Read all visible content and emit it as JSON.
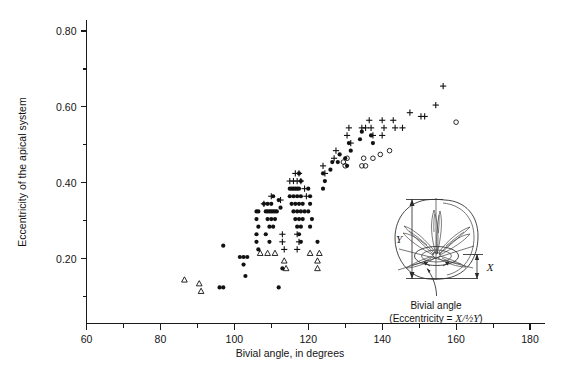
{
  "chart_data": {
    "type": "scatter",
    "title": "",
    "xlabel": "Bivial angle, in degrees",
    "ylabel": "Eccentricity of the apical system",
    "xlim": [
      60,
      180
    ],
    "ylim": [
      0.03,
      0.855
    ],
    "grid": false,
    "legend": "none",
    "x_major_ticks": [
      60,
      80,
      100,
      120,
      140,
      160,
      180
    ],
    "x_major_tick_labels": [
      "60",
      "80",
      "100",
      "120",
      "140",
      "160",
      "180"
    ],
    "x_minor_ticks": [
      70,
      90,
      110,
      130,
      150,
      170
    ],
    "y_major_ticks": [
      0.2,
      0.4,
      0.6,
      0.8
    ],
    "y_major_tick_labels": [
      "0.20",
      "0.40",
      "0.60",
      "0.80"
    ],
    "y_minor_ticks": [
      0.1,
      0.3,
      0.5,
      0.7
    ],
    "series": [
      {
        "name": "filled-circle",
        "marker": "filled-circle",
        "points": [
          [
            97.0,
            0.235
          ],
          [
            97.0,
            0.125
          ],
          [
            101.5,
            0.205
          ],
          [
            102.5,
            0.205
          ],
          [
            103.5,
            0.205
          ],
          [
            102.5,
            0.185
          ],
          [
            103.0,
            0.155
          ],
          [
            106.0,
            0.325
          ],
          [
            106.5,
            0.325
          ],
          [
            106.0,
            0.305
          ],
          [
            106.5,
            0.285
          ],
          [
            106.0,
            0.265
          ],
          [
            106.0,
            0.245
          ],
          [
            106.5,
            0.225
          ],
          [
            108.0,
            0.345
          ],
          [
            108.5,
            0.325
          ],
          [
            109.0,
            0.325
          ],
          [
            109.5,
            0.325
          ],
          [
            110.0,
            0.325
          ],
          [
            110.5,
            0.325
          ],
          [
            111.0,
            0.325
          ],
          [
            111.5,
            0.325
          ],
          [
            109.0,
            0.305
          ],
          [
            110.0,
            0.305
          ],
          [
            111.0,
            0.305
          ],
          [
            109.5,
            0.285
          ],
          [
            110.5,
            0.285
          ],
          [
            109.0,
            0.345
          ],
          [
            110.0,
            0.345
          ],
          [
            110.5,
            0.365
          ],
          [
            108.5,
            0.265
          ],
          [
            109.5,
            0.245
          ],
          [
            112.0,
            0.355
          ],
          [
            112.5,
            0.335
          ],
          [
            113.0,
            0.175
          ],
          [
            115.0,
            0.385
          ],
          [
            115.5,
            0.385
          ],
          [
            116.0,
            0.385
          ],
          [
            116.5,
            0.385
          ],
          [
            117.0,
            0.385
          ],
          [
            117.5,
            0.385
          ],
          [
            115.0,
            0.365
          ],
          [
            116.0,
            0.365
          ],
          [
            117.0,
            0.365
          ],
          [
            118.0,
            0.365
          ],
          [
            115.5,
            0.345
          ],
          [
            116.5,
            0.345
          ],
          [
            117.5,
            0.345
          ],
          [
            118.5,
            0.345
          ],
          [
            116.0,
            0.325
          ],
          [
            117.0,
            0.325
          ],
          [
            118.0,
            0.325
          ],
          [
            119.0,
            0.325
          ],
          [
            116.5,
            0.305
          ],
          [
            117.5,
            0.305
          ],
          [
            118.5,
            0.305
          ],
          [
            117.0,
            0.285
          ],
          [
            118.0,
            0.285
          ],
          [
            117.5,
            0.265
          ],
          [
            118.0,
            0.245
          ],
          [
            118.0,
            0.405
          ],
          [
            117.5,
            0.425
          ],
          [
            120.0,
            0.385
          ],
          [
            120.5,
            0.365
          ],
          [
            120.5,
            0.345
          ],
          [
            120.0,
            0.325
          ],
          [
            121.0,
            0.305
          ],
          [
            120.5,
            0.285
          ],
          [
            122.5,
            0.245
          ],
          [
            124.0,
            0.385
          ],
          [
            124.5,
            0.405
          ],
          [
            124.0,
            0.425
          ],
          [
            126.0,
            0.435
          ],
          [
            126.5,
            0.455
          ],
          [
            128.0,
            0.455
          ],
          [
            128.5,
            0.475
          ],
          [
            130.0,
            0.465
          ],
          [
            130.5,
            0.445
          ],
          [
            131.0,
            0.505
          ],
          [
            131.5,
            0.485
          ],
          [
            134.0,
            0.515
          ],
          [
            134.5,
            0.535
          ],
          [
            137.0,
            0.525
          ],
          [
            137.5,
            0.505
          ],
          [
            112.0,
            0.125
          ],
          [
            96.0,
            0.125
          ]
        ]
      },
      {
        "name": "open-circle",
        "marker": "open-circle",
        "points": [
          [
            129.5,
            0.455
          ],
          [
            130.0,
            0.445
          ],
          [
            130.5,
            0.465
          ],
          [
            134.5,
            0.445
          ],
          [
            135.0,
            0.465
          ],
          [
            135.5,
            0.445
          ],
          [
            137.5,
            0.465
          ],
          [
            139.5,
            0.475
          ],
          [
            142.0,
            0.485
          ],
          [
            160.0,
            0.56
          ]
        ]
      },
      {
        "name": "open-triangle",
        "marker": "open-triangle",
        "points": [
          [
            86.5,
            0.145
          ],
          [
            90.5,
            0.135
          ],
          [
            91.0,
            0.115
          ],
          [
            107.0,
            0.215
          ],
          [
            109.0,
            0.215
          ],
          [
            111.0,
            0.215
          ],
          [
            113.5,
            0.195
          ],
          [
            114.0,
            0.175
          ],
          [
            120.5,
            0.215
          ],
          [
            123.0,
            0.215
          ],
          [
            122.5,
            0.195
          ],
          [
            122.5,
            0.175
          ]
        ]
      },
      {
        "name": "plus",
        "marker": "plus",
        "points": [
          [
            108.0,
            0.345
          ],
          [
            110.0,
            0.365
          ],
          [
            112.5,
            0.355
          ],
          [
            115.0,
            0.405
          ],
          [
            116.0,
            0.405
          ],
          [
            117.0,
            0.405
          ],
          [
            118.0,
            0.405
          ],
          [
            116.5,
            0.425
          ],
          [
            117.5,
            0.425
          ],
          [
            119.0,
            0.385
          ],
          [
            119.5,
            0.365
          ],
          [
            117.0,
            0.265
          ],
          [
            117.5,
            0.245
          ],
          [
            117.0,
            0.225
          ],
          [
            113.0,
            0.265
          ],
          [
            113.0,
            0.245
          ],
          [
            113.5,
            0.225
          ],
          [
            124.0,
            0.445
          ],
          [
            124.5,
            0.425
          ],
          [
            127.0,
            0.465
          ],
          [
            127.5,
            0.485
          ],
          [
            130.5,
            0.525
          ],
          [
            131.0,
            0.545
          ],
          [
            131.5,
            0.505
          ],
          [
            134.5,
            0.545
          ],
          [
            135.5,
            0.545
          ],
          [
            136.5,
            0.565
          ],
          [
            137.0,
            0.545
          ],
          [
            137.5,
            0.525
          ],
          [
            140.0,
            0.565
          ],
          [
            140.5,
            0.545
          ],
          [
            140.0,
            0.525
          ],
          [
            143.0,
            0.565
          ],
          [
            143.5,
            0.545
          ],
          [
            145.5,
            0.545
          ],
          [
            147.5,
            0.585
          ],
          [
            150.5,
            0.575
          ],
          [
            151.5,
            0.575
          ],
          [
            154.5,
            0.605
          ],
          [
            156.5,
            0.655
          ]
        ]
      }
    ]
  },
  "inset": {
    "label_y": "Y",
    "label_x": "X",
    "caption_line1": "Bivial angle",
    "caption_line2_prefix": "(Eccentricity = ",
    "caption_line2_formula": "X/½Y",
    "caption_line2_suffix": ")"
  },
  "colors": {
    "axis": "#1a1a1a",
    "marker": "#111111",
    "background": "#ffffff"
  }
}
